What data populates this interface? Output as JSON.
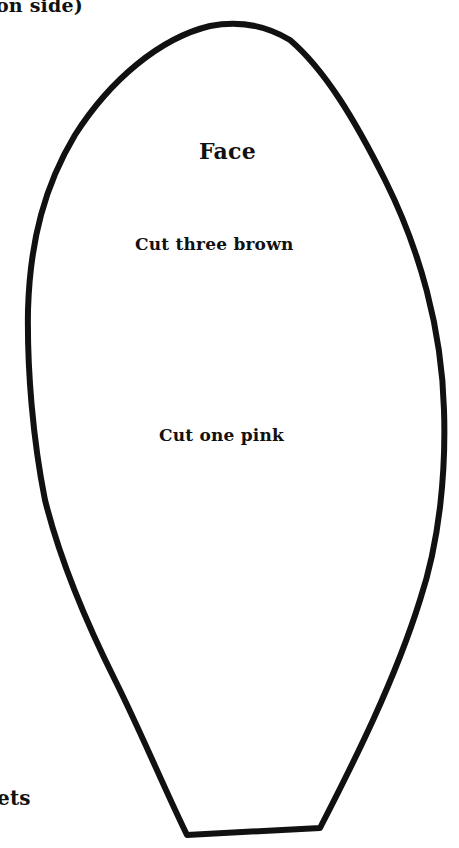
{
  "page": {
    "top_fragment_text": "on side)",
    "bottom_fragment_text": "ets"
  },
  "pattern_piece": {
    "name": "Face",
    "instructions": [
      "Cut three brown",
      "Cut one pink"
    ],
    "outline_color": "#111111",
    "background_color": "#ffffff"
  }
}
